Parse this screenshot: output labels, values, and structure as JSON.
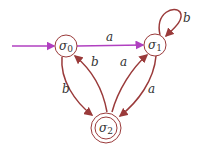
{
  "diagram": {
    "type": "finite-state-automaton",
    "colors": {
      "edge": "#9a3a3a",
      "start_edge": "#b040c0",
      "node_stroke": "#9a3a3a",
      "text": "#333333"
    },
    "states": [
      {
        "id": "s0",
        "symbol": "σ",
        "subscript": "0",
        "start": true,
        "accepting": false
      },
      {
        "id": "s1",
        "symbol": "σ",
        "subscript": "1",
        "start": false,
        "accepting": false
      },
      {
        "id": "s2",
        "symbol": "σ",
        "subscript": "2",
        "start": false,
        "accepting": true
      }
    ],
    "transitions": [
      {
        "from": "s0",
        "to": "s1",
        "label": "a"
      },
      {
        "from": "s1",
        "to": "s1",
        "label": "b"
      },
      {
        "from": "s0",
        "to": "s2",
        "label": "b"
      },
      {
        "from": "s2",
        "to": "s0",
        "label": "b"
      },
      {
        "from": "s2",
        "to": "s1",
        "label": "a"
      },
      {
        "from": "s1",
        "to": "s2",
        "label": "a"
      }
    ]
  }
}
